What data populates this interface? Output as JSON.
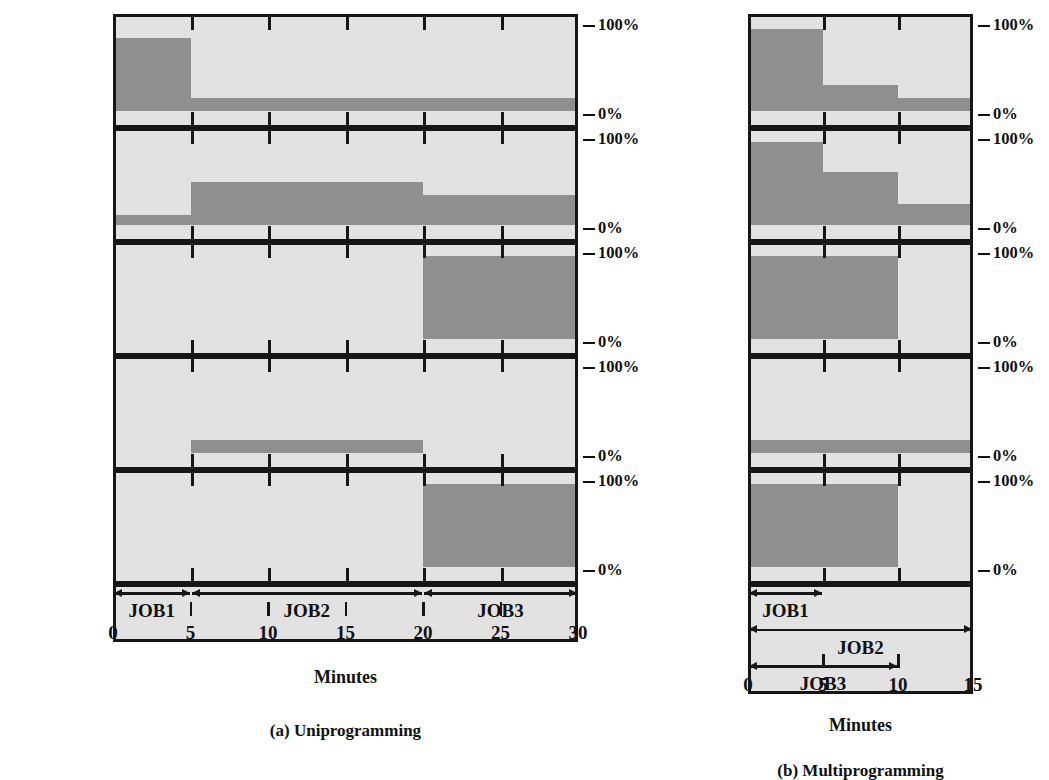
{
  "chart_data": [
    {
      "type": "area",
      "id": "uniprogramming",
      "title": "(a) Uniprogramming",
      "xlabel": "Minutes",
      "ylabel": "",
      "xlim": [
        0,
        30
      ],
      "ylim": [
        0,
        100
      ],
      "xticks": [
        0,
        5,
        10,
        15,
        20,
        25,
        30
      ],
      "ytick_labels": [
        "0%",
        "100%"
      ],
      "grid": false,
      "legend": "none",
      "row_label_job_history": "Job history",
      "resources": [
        {
          "name": "CPU",
          "segments": [
            {
              "x0": 0,
              "x1": 5,
              "value": 85
            },
            {
              "x0": 5,
              "x1": 30,
              "value": 15
            }
          ]
        },
        {
          "name": "Memory",
          "segments": [
            {
              "x0": 0,
              "x1": 5,
              "value": 12
            },
            {
              "x0": 5,
              "x1": 20,
              "value": 50
            },
            {
              "x0": 20,
              "x1": 30,
              "value": 35
            }
          ]
        },
        {
          "name": "Disk",
          "segments": [
            {
              "x0": 0,
              "x1": 20,
              "value": 0
            },
            {
              "x0": 20,
              "x1": 30,
              "value": 97
            }
          ]
        },
        {
          "name": "Terminal",
          "segments": [
            {
              "x0": 0,
              "x1": 5,
              "value": 0
            },
            {
              "x0": 5,
              "x1": 20,
              "value": 15
            },
            {
              "x0": 20,
              "x1": 30,
              "value": 0
            }
          ]
        },
        {
          "name": "Printer",
          "segments": [
            {
              "x0": 0,
              "x1": 20,
              "value": 0
            },
            {
              "x0": 20,
              "x1": 30,
              "value": 97
            }
          ]
        }
      ],
      "jobs": [
        {
          "label": "JOB1",
          "x0": 0,
          "x1": 5,
          "lane": 0
        },
        {
          "label": "JOB2",
          "x0": 5,
          "x1": 20,
          "lane": 0
        },
        {
          "label": "JOB3",
          "x0": 20,
          "x1": 30,
          "lane": 0
        }
      ]
    },
    {
      "type": "area",
      "id": "multiprogramming",
      "title": "(b) Multiprogramming",
      "xlabel": "Minutes",
      "ylabel": "",
      "xlim": [
        0,
        15
      ],
      "ylim": [
        0,
        100
      ],
      "xticks": [
        0,
        5,
        10,
        15
      ],
      "ytick_labels": [
        "0%",
        "100%"
      ],
      "grid": false,
      "legend": "none",
      "row_label_job_history": "Job history",
      "resources": [
        {
          "name": "CPU",
          "segments": [
            {
              "x0": 0,
              "x1": 5,
              "value": 95
            },
            {
              "x0": 5,
              "x1": 10,
              "value": 30
            },
            {
              "x0": 10,
              "x1": 15,
              "value": 15
            }
          ]
        },
        {
          "name": "Memory",
          "segments": [
            {
              "x0": 0,
              "x1": 5,
              "value": 97
            },
            {
              "x0": 5,
              "x1": 10,
              "value": 62
            },
            {
              "x0": 10,
              "x1": 15,
              "value": 25
            }
          ]
        },
        {
          "name": "Disk",
          "segments": [
            {
              "x0": 0,
              "x1": 10,
              "value": 97
            },
            {
              "x0": 10,
              "x1": 15,
              "value": 0
            }
          ]
        },
        {
          "name": "Terminal",
          "segments": [
            {
              "x0": 0,
              "x1": 15,
              "value": 15
            }
          ]
        },
        {
          "name": "Printer",
          "segments": [
            {
              "x0": 0,
              "x1": 10,
              "value": 97
            },
            {
              "x0": 10,
              "x1": 15,
              "value": 0
            }
          ]
        }
      ],
      "jobs": [
        {
          "label": "JOB1",
          "x0": 0,
          "x1": 5,
          "lane": 0
        },
        {
          "label": "JOB2",
          "x0": 0,
          "x1": 15,
          "lane": 1
        },
        {
          "label": "JOB3",
          "x0": 0,
          "x1": 10,
          "lane": 2
        }
      ]
    }
  ],
  "colors": {
    "panel_background": "#e2e2e2",
    "bar_fill": "#8f8f8f",
    "ink": "#161616",
    "page_background": "#ffffff"
  }
}
